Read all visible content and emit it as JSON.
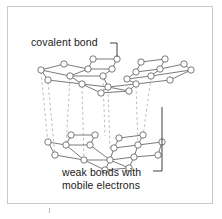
{
  "figure": {
    "background_color": "#ffffff",
    "frame_color": "#c9c9c9"
  },
  "labels": {
    "covalent": "covalent bond",
    "weak_line1": "weak bonds with",
    "weak_line2": "mobile electrons"
  },
  "colors": {
    "bond_stroke": "#6b6b6b",
    "atom_stroke": "#6b6b6b",
    "atom_fill": "#ffffff",
    "weak_bond_stroke": "#b9b4ad",
    "leader_stroke": "#2b2b2b",
    "text": "#1a1a1a"
  },
  "structure": {
    "type": "graphite-lattice",
    "layers": 2,
    "atom_radius": 3.2,
    "top_layer": {
      "name": "upper graphene sheet",
      "sub_rows": 3,
      "atoms": [
        [
          93,
          59
        ],
        [
          117,
          59
        ],
        [
          141,
          62
        ],
        [
          165,
          59
        ],
        [
          64,
          64
        ],
        [
          88,
          69
        ],
        [
          112,
          69
        ],
        [
          136,
          72
        ],
        [
          160,
          69
        ],
        [
          184,
          64
        ],
        [
          41,
          70
        ],
        [
          70,
          76
        ],
        [
          103,
          76
        ],
        [
          127,
          79
        ],
        [
          151,
          76
        ],
        [
          191,
          70
        ],
        [
          48,
          80
        ],
        [
          82,
          84
        ],
        [
          108,
          87
        ],
        [
          136,
          84
        ],
        [
          170,
          80
        ],
        [
          101,
          93
        ],
        [
          129,
          91
        ]
      ]
    },
    "bottom_layer": {
      "name": "lower graphene sheet",
      "sub_rows": 3,
      "atoms": [
        [
          71,
          135
        ],
        [
          95,
          135
        ],
        [
          119,
          138
        ],
        [
          143,
          135
        ],
        [
          48,
          142
        ],
        [
          66,
          145
        ],
        [
          90,
          145
        ],
        [
          114,
          148
        ],
        [
          138,
          145
        ],
        [
          162,
          142
        ],
        [
          55,
          155
        ],
        [
          84,
          160
        ],
        [
          110,
          160
        ],
        [
          134,
          157
        ],
        [
          158,
          155
        ],
        [
          105,
          170
        ],
        [
          129,
          168
        ]
      ]
    },
    "weak_bond_count": 8,
    "weak_bond_style": "vertical dashed"
  },
  "leaders": {
    "covalent_leader": "from label right edge, horizontal then down to top-layer bond",
    "weak_leader": "bracket from label right edge up along right side to interlayer region"
  }
}
